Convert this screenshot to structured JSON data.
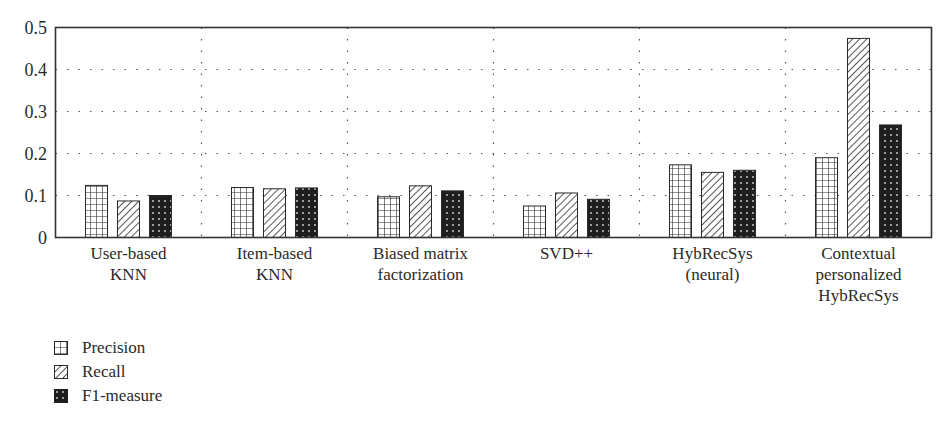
{
  "chart_data": {
    "type": "bar",
    "title": "",
    "xlabel": "",
    "ylabel": "",
    "ylim": [
      0,
      0.5
    ],
    "yticks": [
      "0",
      "0.1",
      "0.2",
      "0.3",
      "0.4",
      "0.5"
    ],
    "grid": "dotted",
    "legend_position": "bottom-left",
    "categories": [
      [
        "User-based",
        "KNN"
      ],
      [
        "Item-based",
        "KNN"
      ],
      [
        "Biased matrix",
        "factorization"
      ],
      [
        "SVD++"
      ],
      [
        "HybRecSys",
        "(neural)"
      ],
      [
        "Contextual",
        "personalized",
        "HybRecSys"
      ]
    ],
    "series": [
      {
        "name": "Precision",
        "pattern": "grid",
        "values": [
          0.124,
          0.119,
          0.097,
          0.075,
          0.173,
          0.19
        ]
      },
      {
        "name": "Recall",
        "pattern": "diagonal",
        "values": [
          0.087,
          0.116,
          0.123,
          0.106,
          0.155,
          0.474
        ]
      },
      {
        "name": "F1-measure",
        "pattern": "dotted-dark",
        "values": [
          0.1,
          0.118,
          0.111,
          0.091,
          0.16,
          0.268
        ]
      }
    ]
  },
  "legend": {
    "items": [
      "Precision",
      "Recall",
      "F1-measure"
    ]
  },
  "colors": {
    "axis": "#333333",
    "grid": "#555555",
    "bar_stroke": "#2a2a2a",
    "f1_fill": "#1e1e1e"
  }
}
